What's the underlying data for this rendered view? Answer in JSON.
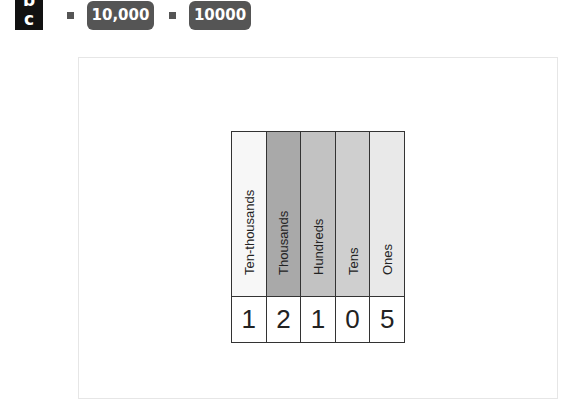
{
  "header": {
    "label_letters": [
      "b",
      "c"
    ],
    "items": [
      {
        "value": "10,000"
      },
      {
        "value": "10000"
      }
    ]
  },
  "place_value_chart": {
    "columns": [
      {
        "label": "Ten-thousands",
        "digit": "1",
        "color": "#f7f7f7"
      },
      {
        "label": "Thousands",
        "digit": "2",
        "color": "#a9a9a9"
      },
      {
        "label": "Hundreds",
        "digit": "1",
        "color": "#c2c2c2"
      },
      {
        "label": "Tens",
        "digit": "0",
        "color": "#cfcfcf"
      },
      {
        "label": "Ones",
        "digit": "5",
        "color": "#e9e9e9"
      }
    ]
  }
}
